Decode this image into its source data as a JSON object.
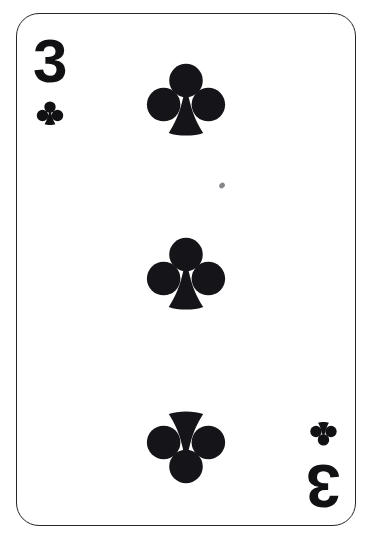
{
  "card": {
    "rank": "3",
    "rank_name": "Three",
    "suit": "clubs",
    "suit_symbol": "♣",
    "full_name": "Three of Clubs",
    "color": "#111114",
    "border_color": "#25252a",
    "face_color": "#ffffff",
    "pip_count": 3
  },
  "indices": [
    {
      "position": "top-left",
      "rank": "3",
      "suit_icon": "club-icon",
      "rotated": false
    },
    {
      "position": "bottom-right",
      "rank": "3",
      "suit_icon": "club-icon",
      "rotated": true
    }
  ],
  "pips": [
    {
      "slot": "top",
      "suit_icon": "club-icon",
      "inverted": false
    },
    {
      "slot": "middle",
      "suit_icon": "club-icon",
      "inverted": false
    },
    {
      "slot": "bottom",
      "suit_icon": "club-icon",
      "inverted": true
    }
  ],
  "artifacts": [
    {
      "name": "scan-speck",
      "shape": "small-dark-fleck"
    }
  ]
}
